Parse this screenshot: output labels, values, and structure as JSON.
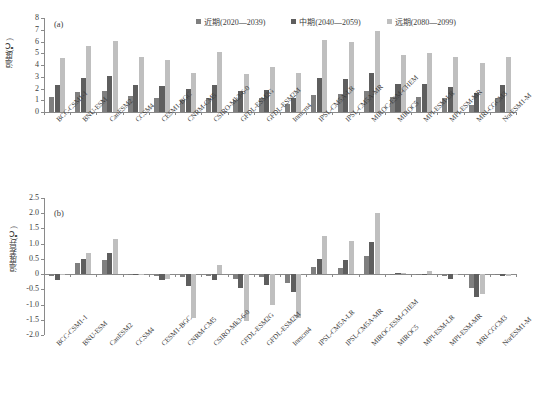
{
  "figure": {
    "panel_a_tag": "(a)",
    "panel_b_tag": "(b)"
  },
  "legend": {
    "items": [
      {
        "label": "近期(2020—2039)",
        "color": "#7f7f7f"
      },
      {
        "label": "中期(2040—2059)",
        "color": "#5e5e5e"
      },
      {
        "label": "远期(2080—2099)",
        "color": "#bfbfbf"
      }
    ]
  },
  "chart_data": [
    {
      "type": "bar",
      "id": "panel-a",
      "title": "(a)",
      "xlabel": "",
      "ylabel": "温度(℃)",
      "ylim": [
        0,
        8
      ],
      "yticks": [
        0,
        1,
        2,
        3,
        4,
        5,
        6,
        7,
        8
      ],
      "ytick_labels": [
        "0",
        "1",
        "2",
        "3",
        "4",
        "5",
        "6",
        "7",
        "8"
      ],
      "grid": false,
      "legend_position": "top-right",
      "categories": [
        "BCC-CSM1-1",
        "BNU-ESM",
        "CanESM2",
        "CCSM4",
        "CESM1-BGC",
        "CNRM-CM5",
        "CSIRO-Mk3-6-0",
        "GFDL-ESM2G",
        "GFDL-ESM2M",
        "Inmcm4",
        "IPSL-CM5A-LR",
        "IPSL-CM5A-MR",
        "MIROC-ESM-CHEM",
        "MIROC5",
        "MPI-ESM-LR",
        "MPI-ESM-MR",
        "MRI-CGCM3",
        "NorESM1-M"
      ],
      "series": [
        {
          "name": "近期(2020—2039)",
          "color": "#7f7f7f",
          "values": [
            1.3,
            1.7,
            1.8,
            1.35,
            1.2,
            1.0,
            1.15,
            1.0,
            1.15,
            0.7,
            1.45,
            1.5,
            1.8,
            1.3,
            1.25,
            1.15,
            0.6,
            1.2
          ]
        },
        {
          "name": "中期(2040—2059)",
          "color": "#5e5e5e",
          "values": [
            2.3,
            2.9,
            3.05,
            2.3,
            2.2,
            1.95,
            2.3,
            1.8,
            1.85,
            1.2,
            2.9,
            2.8,
            3.35,
            2.4,
            2.4,
            2.1,
            1.6,
            2.3
          ]
        },
        {
          "name": "远期(2080—2099)",
          "color": "#bfbfbf",
          "values": [
            4.6,
            5.6,
            6.05,
            4.7,
            4.4,
            3.35,
            5.1,
            3.25,
            3.8,
            3.35,
            6.1,
            5.95,
            6.9,
            4.85,
            5.0,
            4.65,
            4.15,
            4.65
          ]
        }
      ]
    },
    {
      "type": "bar",
      "id": "panel-b",
      "title": "(b)",
      "xlabel": "",
      "ylabel": "温度差异(℃)",
      "ylim": [
        -2.0,
        2.5
      ],
      "yticks": [
        2.5,
        2.0,
        1.5,
        1.0,
        0.5,
        0,
        -0.5,
        -1.0,
        -1.5,
        -2.0
      ],
      "ytick_labels": [
        "2.5",
        "2.0",
        "1.5",
        "1.0",
        "0.5",
        "0",
        "-0.5",
        "-1.0",
        "-1.5",
        "-2.0"
      ],
      "grid": false,
      "legend_position": "none",
      "categories": [
        "BCC-CSM1-1",
        "BNU-ESM",
        "CanESM2",
        "CCSM4",
        "CESM1-BGC",
        "CNRM-CM5",
        "CSIRO-Mk3-6-0",
        "GFDL-ESM2G",
        "GFDL-ESM2M",
        "Inmcm4",
        "IPSL-CM5A-LR",
        "IPSL-CM5A-MR",
        "MIROC-ESM-CHEM",
        "MIROC5",
        "MPI-ESM-LR",
        "MPI-ESM-MR",
        "MRI-CGCM3",
        "NorESM1-M"
      ],
      "series": [
        {
          "name": "近期(2020—2039)",
          "color": "#7f7f7f",
          "values": [
            -0.05,
            0.35,
            0.45,
            0.0,
            -0.05,
            -0.1,
            -0.05,
            -0.15,
            -0.1,
            -0.3,
            0.25,
            0.2,
            0.6,
            0.02,
            0.0,
            -0.05,
            -0.45,
            -0.03
          ]
        },
        {
          "name": "中期(2040—2059)",
          "color": "#5e5e5e",
          "values": [
            -0.2,
            0.5,
            0.7,
            -0.02,
            -0.2,
            -0.4,
            -0.2,
            -0.45,
            -0.35,
            -0.6,
            0.5,
            0.45,
            1.05,
            0.05,
            0.02,
            -0.15,
            -0.75,
            -0.05
          ]
        },
        {
          "name": "远期(2080—2099)",
          "color": "#bfbfbf",
          "values": [
            0.0,
            0.7,
            1.15,
            0.02,
            -0.15,
            -1.45,
            0.3,
            -1.55,
            -1.0,
            -1.45,
            1.25,
            1.1,
            2.0,
            0.05,
            0.1,
            0.0,
            -0.65,
            -0.05
          ]
        }
      ]
    }
  ]
}
